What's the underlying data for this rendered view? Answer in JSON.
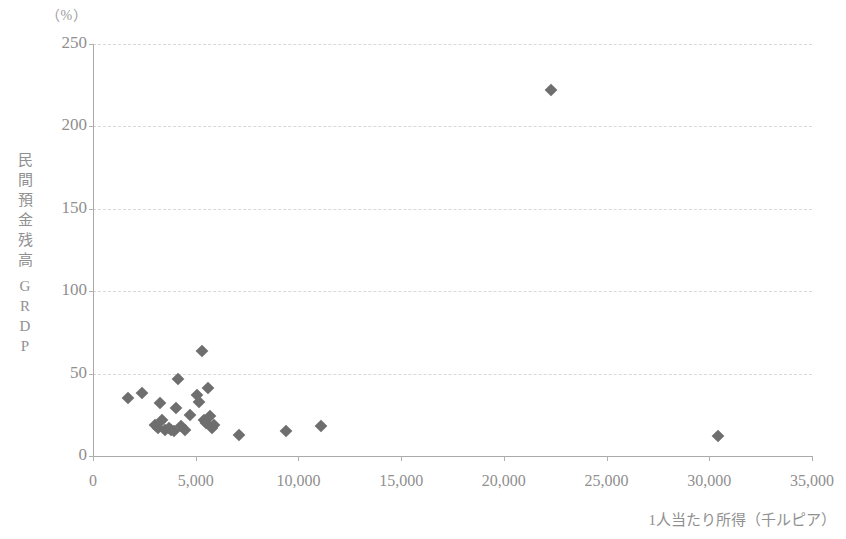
{
  "chart_data": {
    "type": "scatter",
    "title": "",
    "xlabel": "1人当たり所得（千ルピア）",
    "ylabel": "民間預金残高／GRDP",
    "ylabel_chars": [
      "民",
      "間",
      "預",
      "金",
      "残",
      "高",
      "G",
      "R",
      "D",
      "P"
    ],
    "y_unit": "（%）",
    "xlim": [
      0,
      35000
    ],
    "ylim": [
      0,
      250
    ],
    "xticks": [
      0,
      5000,
      10000,
      15000,
      20000,
      25000,
      30000,
      35000
    ],
    "xtick_labels": [
      "0",
      "5,000",
      "10,000",
      "15,000",
      "20,000",
      "25,000",
      "30,000",
      "35,000"
    ],
    "yticks": [
      0,
      50,
      100,
      150,
      200,
      250
    ],
    "ytick_labels": [
      "0",
      "50",
      "100",
      "150",
      "200",
      "250"
    ],
    "grid": true,
    "grid_axis": "y",
    "legend": false,
    "marker": "diamond",
    "marker_color": "#6e6e6e",
    "points": [
      {
        "x": 1700,
        "y": 35
      },
      {
        "x": 2400,
        "y": 38
      },
      {
        "x": 3000,
        "y": 19
      },
      {
        "x": 3150,
        "y": 17
      },
      {
        "x": 3250,
        "y": 32
      },
      {
        "x": 3350,
        "y": 22
      },
      {
        "x": 3500,
        "y": 16
      },
      {
        "x": 3700,
        "y": 17
      },
      {
        "x": 3800,
        "y": 16
      },
      {
        "x": 3950,
        "y": 15
      },
      {
        "x": 4050,
        "y": 29
      },
      {
        "x": 4150,
        "y": 47
      },
      {
        "x": 4300,
        "y": 18
      },
      {
        "x": 4500,
        "y": 16
      },
      {
        "x": 4700,
        "y": 25
      },
      {
        "x": 5050,
        "y": 37
      },
      {
        "x": 5150,
        "y": 33
      },
      {
        "x": 5300,
        "y": 64
      },
      {
        "x": 5400,
        "y": 22
      },
      {
        "x": 5500,
        "y": 20
      },
      {
        "x": 5600,
        "y": 41
      },
      {
        "x": 5700,
        "y": 24
      },
      {
        "x": 5800,
        "y": 17
      },
      {
        "x": 5900,
        "y": 19
      },
      {
        "x": 7100,
        "y": 13
      },
      {
        "x": 9400,
        "y": 15
      },
      {
        "x": 11100,
        "y": 18
      },
      {
        "x": 22300,
        "y": 222
      },
      {
        "x": 30400,
        "y": 12
      }
    ]
  }
}
